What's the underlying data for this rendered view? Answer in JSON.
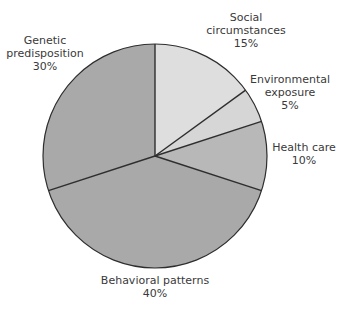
{
  "chart_data": {
    "type": "pie",
    "title": "",
    "start_angle_deg": 0,
    "direction": "clockwise",
    "slices": [
      {
        "label": "Social circumstances",
        "value": 15,
        "display": "15%",
        "color": "#dedede"
      },
      {
        "label": "Environmental exposure",
        "value": 5,
        "display": "5%",
        "color": "#d6d6d6"
      },
      {
        "label": "Health care",
        "value": 10,
        "display": "10%",
        "color": "#b8b8b8"
      },
      {
        "label": "Behavioral patterns",
        "value": 40,
        "display": "40%",
        "color": "#a9a9a9"
      },
      {
        "label": "Genetic predisposition",
        "value": 30,
        "display": "30%",
        "color": "#a9a9a9"
      }
    ]
  },
  "labels": {
    "social": {
      "line1": "Social",
      "line2": "circumstances",
      "pct": "15%"
    },
    "environmental": {
      "line1": "Environmental",
      "line2": "exposure",
      "pct": "5%"
    },
    "health": {
      "line1": "Health care",
      "pct": "10%"
    },
    "behavioral": {
      "line1": "Behavioral patterns",
      "pct": "40%"
    },
    "genetic": {
      "line1": "Genetic",
      "line2": "predisposition",
      "pct": "30%"
    }
  }
}
